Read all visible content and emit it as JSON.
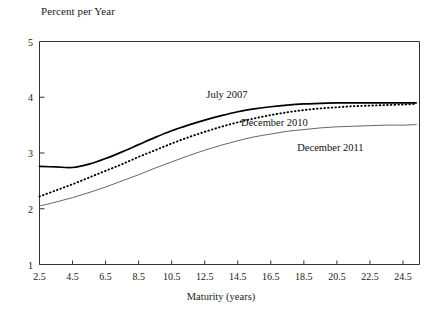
{
  "chart_data": {
    "type": "line",
    "title": "",
    "ylabel": "Percent per Year",
    "xlabel": "Maturity (years)",
    "xlim": [
      2.5,
      25.5
    ],
    "ylim": [
      1,
      5
    ],
    "grid": false,
    "legend_position": "inline-annotations",
    "xticks": [
      "2.5",
      "4.5",
      "6.5",
      "8.5",
      "10.5",
      "12.5",
      "14.5",
      "16.5",
      "18.5",
      "20.5",
      "22.5",
      "24.5"
    ],
    "xtick_values": [
      2.5,
      4.5,
      6.5,
      8.5,
      10.5,
      12.5,
      14.5,
      16.5,
      18.5,
      20.5,
      22.5,
      24.5
    ],
    "yticks": [
      "1",
      "2",
      "3",
      "4",
      "5"
    ],
    "ytick_values": [
      1,
      2,
      3,
      4,
      5
    ],
    "x": [
      2.5,
      3.5,
      4.5,
      5.5,
      6.5,
      7.5,
      8.5,
      9.5,
      10.5,
      11.5,
      12.5,
      13.5,
      14.5,
      15.5,
      16.5,
      17.5,
      18.5,
      19.5,
      20.5,
      21.5,
      22.5,
      23.5,
      24.5,
      25.3
    ],
    "series": [
      {
        "name": "July 2007",
        "style": "solid-thick",
        "color": "#000000",
        "values": [
          2.76,
          2.75,
          2.74,
          2.8,
          2.9,
          3.02,
          3.15,
          3.28,
          3.4,
          3.5,
          3.59,
          3.67,
          3.74,
          3.79,
          3.83,
          3.86,
          3.88,
          3.89,
          3.9,
          3.9,
          3.9,
          3.9,
          3.9,
          3.9
        ],
        "label_position": {
          "x": 12.6,
          "y": 4.03
        }
      },
      {
        "name": "December 2010",
        "style": "dotted",
        "color": "#000000",
        "values": [
          2.22,
          2.33,
          2.44,
          2.56,
          2.68,
          2.8,
          2.93,
          3.05,
          3.17,
          3.28,
          3.38,
          3.47,
          3.55,
          3.62,
          3.68,
          3.73,
          3.77,
          3.8,
          3.82,
          3.84,
          3.85,
          3.86,
          3.87,
          3.88
        ],
        "label_position": {
          "x": 14.7,
          "y": 3.52
        }
      },
      {
        "name": "December 2011",
        "style": "solid-thin",
        "color": "#000000",
        "values": [
          2.05,
          2.12,
          2.2,
          2.29,
          2.39,
          2.5,
          2.61,
          2.73,
          2.84,
          2.95,
          3.05,
          3.14,
          3.22,
          3.29,
          3.34,
          3.39,
          3.42,
          3.45,
          3.47,
          3.48,
          3.49,
          3.5,
          3.5,
          3.51
        ],
        "label_position": {
          "x": 18.1,
          "y": 3.07
        }
      }
    ]
  }
}
